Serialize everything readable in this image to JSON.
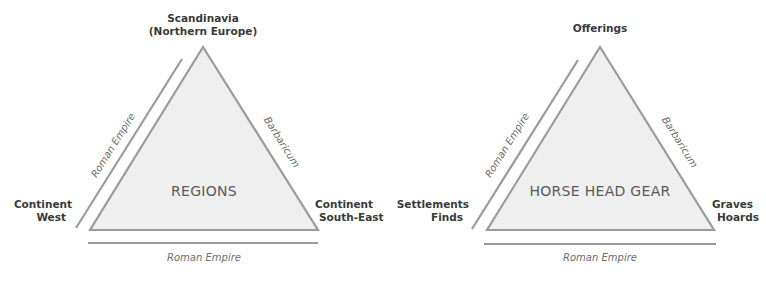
{
  "colors": {
    "triangle_fill": "#efefef",
    "stroke": "#9b9b9b",
    "text_bold": "#3a3a3a",
    "text_italic": "#6e6e6e",
    "text_center": "#5a5a5a"
  },
  "diagrams": [
    {
      "center_label": "REGIONS",
      "top_vertex": {
        "line1": "Scandinavia",
        "line2": "(Northern Europe)"
      },
      "left_vertex": {
        "line1": "Continent",
        "line2": "West"
      },
      "right_vertex": {
        "line1": "Continent",
        "line2": "South-East"
      },
      "left_side_label": "Roman Empire",
      "right_side_label": "Barbaricum",
      "bottom_side_label": "Roman Empire"
    },
    {
      "center_label": "HORSE HEAD GEAR",
      "top_vertex": {
        "line1": "Offerings"
      },
      "left_vertex": {
        "line1": "Settlements",
        "line2": "Finds"
      },
      "right_vertex": {
        "line1": "Graves",
        "line2": "Hoards"
      },
      "left_side_label": "Roman Empire",
      "right_side_label": "Barbaricum",
      "bottom_side_label": "Roman Empire"
    }
  ]
}
